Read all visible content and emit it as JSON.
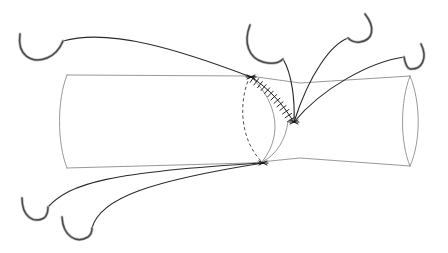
{
  "figure": {
    "title": "Surgical anastomosis suture diagram",
    "background_color": "#ffffff",
    "width": 448,
    "height": 253
  },
  "colors": {
    "tube_outline": "#8d8d8d",
    "hidden_edge_dashed": "#3a3a3a",
    "suture_line": "#1f1f1f",
    "thread": "#2b2b2b",
    "needle_body": "#4a4a4a",
    "needle_shadow": "#c2c2c2",
    "knot": "#101010"
  },
  "tube": {
    "name": "cylindrical-vessel-body",
    "top_edge": "M 67,75 L 250,76 L 300,83 L 410,76",
    "bottom_edge": "M 67,168 L 250,163 L 300,158 L 410,166",
    "left_cap": "M 67,75 C 57,100 57,143 67,168",
    "right_cap": "M 410,76 C 421,102 421,142 410,166",
    "right_cap_inner": "M 410,76 C 400,102 400,142 410,166"
  },
  "cross_section": {
    "name": "oblique-cut-plane",
    "hidden_arc": "M 250,76 C 238,102 240,140 262,162",
    "visible_arc": "M 250,76 C 272,96 287,130 262,162",
    "visible_arc_lower": "M 288,121 C 286,140 276,155 262,162"
  },
  "suture": {
    "name": "running-suture-line",
    "path": "M 251,77 C 268,88 283,104 293,121",
    "stitch_count": 13,
    "tick_length": 6.5
  },
  "anchor_points": [
    {
      "name": "upper-anchor-knot",
      "x": 251,
      "y": 77
    },
    {
      "name": "lower-anchor-knot",
      "x": 263,
      "y": 163
    },
    {
      "name": "mid-anchor-knot",
      "x": 294,
      "y": 122
    }
  ],
  "threads": [
    {
      "name": "thread-upper-left",
      "from": "upper-left-needle",
      "to": "upper-anchor-knot",
      "path": "M 63,41 C 110,28 180,50 251,77"
    },
    {
      "name": "thread-mid-upper",
      "from": "mid-upper-needle",
      "to": "mid-anchor-knot",
      "path": "M 283,59 C 292,74 295,100 294,122"
    },
    {
      "name": "thread-upper-right-a",
      "from": "upper-right-needle",
      "to": "mid-anchor-knot",
      "path": "M 348,38 C 332,44 310,72 294,122"
    },
    {
      "name": "thread-upper-right-b",
      "from": "far-right-needle",
      "to": "mid-anchor-knot",
      "path": "M 404,57 C 370,62 322,88 294,122"
    },
    {
      "name": "thread-lower-left-a",
      "from": "lower-left-needle-a",
      "to": "lower-anchor-knot",
      "path": "M 48,207 C 70,183 110,172 263,163"
    },
    {
      "name": "thread-lower-left-b",
      "from": "lower-left-needle-b",
      "to": "lower-anchor-knot",
      "path": "M 92,228 C 100,198 150,181 263,163"
    }
  ],
  "needles": [
    {
      "name": "needle-upper-left",
      "label": "curved surgical needle, upper left",
      "path": "M 20,34 C 17,55 31,64 47,58 C 57,54 61,46 63,41"
    },
    {
      "name": "needle-mid-upper",
      "label": "curved surgical needle, mid upper",
      "path": "M 250,25 C 243,43 249,58 263,62 C 274,65 280,62 283,59"
    },
    {
      "name": "needle-upper-right",
      "label": "curved surgical needle, upper right",
      "path": "M 365,14 C 376,28 373,40 360,42 C 353,43 350,40 348,38"
    },
    {
      "name": "needle-far-right",
      "label": "curved surgical needle, far right",
      "path": "M 421,44 C 428,58 422,70 410,69 C 406,68 405,62 404,57"
    },
    {
      "name": "needle-lower-left-a",
      "label": "curved surgical needle, lower left",
      "path": "M 22,198 C 22,216 33,224 44,218 C 48,215 48,210 48,207"
    },
    {
      "name": "needle-lower-left-b",
      "label": "curved surgical needle, lower left second",
      "path": "M 62,217 C 63,236 76,244 88,237 C 92,234 92,231 92,228"
    }
  ]
}
